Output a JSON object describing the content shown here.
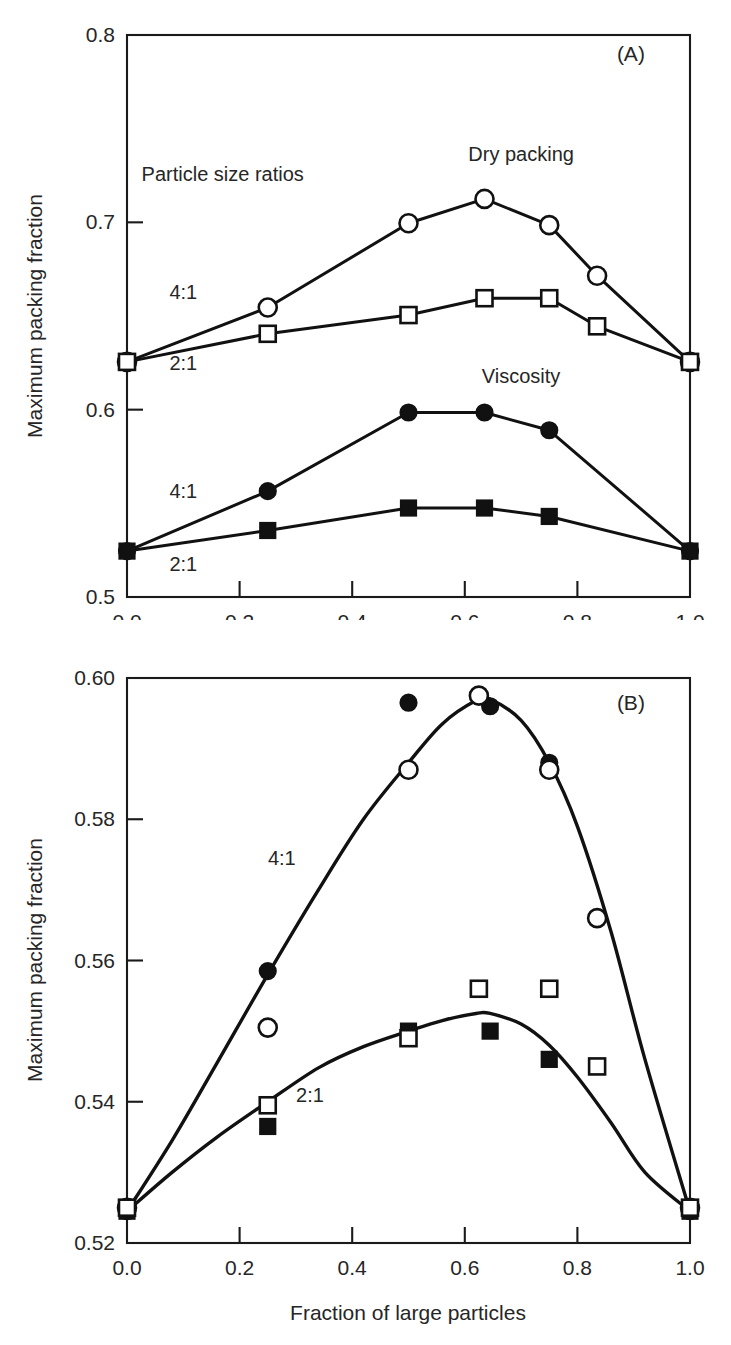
{
  "figure": {
    "xlabel": "Fraction of large particles"
  },
  "chart_data": [
    {
      "type": "line",
      "panel": "A",
      "panel_letter": "(A)",
      "title": "",
      "xlabel": "",
      "ylabel": "Maximum packing fraction",
      "xlim": [
        0.0,
        1.0
      ],
      "ylim": [
        0.5,
        0.8
      ],
      "xticks": [
        0.0,
        0.2,
        0.4,
        0.6,
        0.8,
        1.0
      ],
      "xticklabels": [
        "0.0",
        "0.2",
        "0.4",
        "0.6",
        "0.8",
        "1.0"
      ],
      "yticks": [
        0.5,
        0.6,
        0.7,
        0.8
      ],
      "yticklabels": [
        "0.5",
        "0.6",
        "0.7",
        "0.8"
      ],
      "grid": false,
      "legend": "inline-annotations",
      "annotations": [
        {
          "text": "Particle size ratios",
          "x": 0.17,
          "y": 0.722
        },
        {
          "text": "Dry packing",
          "x": 0.7,
          "y": 0.733
        },
        {
          "text": "Viscosity",
          "x": 0.7,
          "y": 0.614
        },
        {
          "text": "4:1",
          "x": 0.1,
          "y": 0.659
        },
        {
          "text": "2:1",
          "x": 0.1,
          "y": 0.621
        },
        {
          "text": "4:1",
          "x": 0.1,
          "y": 0.553
        },
        {
          "text": "2:1",
          "x": 0.1,
          "y": 0.514
        },
        {
          "text": "(A)",
          "x": 0.895,
          "y": 0.786
        }
      ],
      "series": [
        {
          "name": "Dry packing 4:1",
          "marker": "open-circle",
          "x": [
            0.0,
            0.25,
            0.5,
            0.635,
            0.75,
            0.835,
            1.0
          ],
          "values": [
            0.6255,
            0.6545,
            0.6995,
            0.7125,
            0.6985,
            0.6715,
            0.6255
          ]
        },
        {
          "name": "Dry packing 2:1",
          "marker": "open-square",
          "x": [
            0.0,
            0.25,
            0.5,
            0.635,
            0.75,
            0.835,
            1.0
          ],
          "values": [
            0.6255,
            0.6405,
            0.6505,
            0.6595,
            0.6595,
            0.6445,
            0.6255
          ]
        },
        {
          "name": "Viscosity 4:1",
          "marker": "filled-circle",
          "x": [
            0.0,
            0.25,
            0.5,
            0.635,
            0.75,
            1.0
          ],
          "values": [
            0.5245,
            0.5565,
            0.5985,
            0.5985,
            0.589,
            0.5245
          ]
        },
        {
          "name": "Viscosity 2:1",
          "marker": "filled-square",
          "x": [
            0.0,
            0.25,
            0.5,
            0.635,
            0.75,
            1.0
          ],
          "values": [
            0.5245,
            0.5355,
            0.5475,
            0.5475,
            0.543,
            0.5245
          ]
        }
      ]
    },
    {
      "type": "scatter",
      "panel": "B",
      "panel_letter": "(B)",
      "title": "",
      "xlabel": "Fraction of large particles",
      "ylabel": "Maximum packing fraction",
      "xlim": [
        0.0,
        1.0
      ],
      "ylim": [
        0.52,
        0.6
      ],
      "xticks": [
        0.0,
        0.2,
        0.4,
        0.6,
        0.8,
        1.0
      ],
      "xticklabels": [
        "0.0",
        "0.2",
        "0.4",
        "0.6",
        "0.8",
        "1.0"
      ],
      "yticks": [
        0.52,
        0.54,
        0.56,
        0.58,
        0.6
      ],
      "yticklabels": [
        "0.52",
        "0.54",
        "0.56",
        "0.58",
        "0.60"
      ],
      "grid": false,
      "legend": "inline-annotations",
      "annotations": [
        {
          "text": "4:1",
          "x": 0.275,
          "y": 0.5735
        },
        {
          "text": "2:1",
          "x": 0.325,
          "y": 0.54
        },
        {
          "text": "(B)",
          "x": 0.895,
          "y": 0.5955
        }
      ],
      "series": [
        {
          "name": "4:1 filled circles",
          "marker": "filled-circle",
          "x": [
            0.0,
            0.25,
            0.5,
            0.645,
            0.75,
            1.0
          ],
          "values": [
            0.5245,
            0.5585,
            0.5965,
            0.596,
            0.588,
            0.5245
          ]
        },
        {
          "name": "4:1 open circles",
          "marker": "open-circle",
          "x": [
            0.0,
            0.25,
            0.5,
            0.625,
            0.75,
            0.835,
            1.0
          ],
          "values": [
            0.525,
            0.5505,
            0.587,
            0.5975,
            0.587,
            0.566,
            0.525
          ]
        },
        {
          "name": "2:1 filled squares",
          "marker": "filled-square",
          "x": [
            0.0,
            0.25,
            0.5,
            0.645,
            0.75,
            1.0
          ],
          "values": [
            0.5245,
            0.5365,
            0.55,
            0.55,
            0.546,
            0.5245
          ]
        },
        {
          "name": "2:1 open squares",
          "marker": "open-square",
          "x": [
            0.0,
            0.25,
            0.5,
            0.625,
            0.75,
            0.835,
            1.0
          ],
          "values": [
            0.525,
            0.5395,
            0.549,
            0.556,
            0.556,
            0.545,
            0.525
          ]
        }
      ],
      "fit_curves": [
        {
          "name": "4:1 fit",
          "points_x": [
            0.0,
            0.08,
            0.16,
            0.25,
            0.34,
            0.42,
            0.5,
            0.56,
            0.62,
            0.645,
            0.7,
            0.75,
            0.8,
            0.86,
            0.92,
            1.0
          ],
          "points_y": [
            0.5245,
            0.5345,
            0.5455,
            0.558,
            0.57,
            0.58,
            0.588,
            0.5935,
            0.5968,
            0.597,
            0.594,
            0.588,
            0.579,
            0.564,
            0.546,
            0.5245
          ]
        },
        {
          "name": "2:1 fit",
          "points_x": [
            0.0,
            0.08,
            0.16,
            0.25,
            0.34,
            0.42,
            0.5,
            0.56,
            0.62,
            0.645,
            0.7,
            0.75,
            0.8,
            0.86,
            0.92,
            1.0
          ],
          "points_y": [
            0.5245,
            0.53,
            0.535,
            0.54,
            0.5448,
            0.5478,
            0.55,
            0.5515,
            0.5525,
            0.5525,
            0.551,
            0.548,
            0.5435,
            0.537,
            0.53,
            0.5245
          ]
        }
      ]
    }
  ]
}
